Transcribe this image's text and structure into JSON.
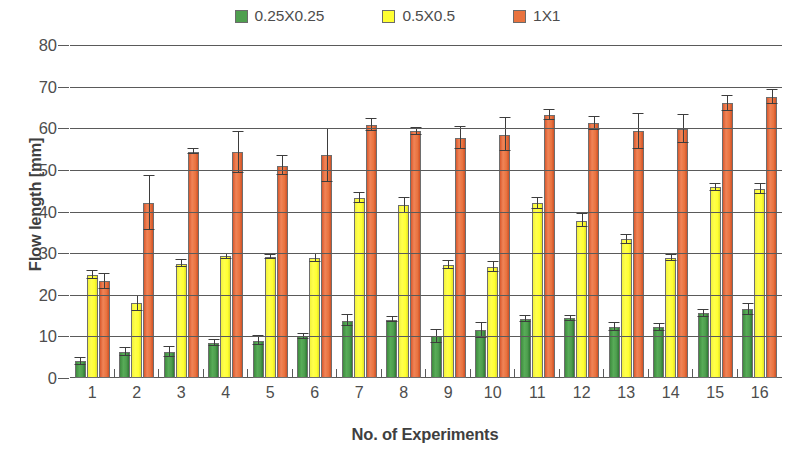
{
  "chart_data": {
    "type": "bar",
    "title": "",
    "xlabel": "No. of Experiments",
    "ylabel": "Flow length [mm]",
    "ylim": [
      0,
      80
    ],
    "ytick_labels": [
      "0",
      "10",
      "20",
      "30",
      "40",
      "50",
      "60",
      "70",
      "80"
    ],
    "ytick_values": [
      0,
      10,
      20,
      30,
      40,
      50,
      60,
      70,
      80
    ],
    "grid": true,
    "legend_position": "top-center",
    "categories": [
      "1",
      "2",
      "3",
      "4",
      "5",
      "6",
      "7",
      "8",
      "9",
      "10",
      "11",
      "12",
      "13",
      "14",
      "15",
      "16"
    ],
    "series": [
      {
        "name": "0.25X0.25",
        "color": "#4f9f4f",
        "values": [
          4.0,
          6.2,
          6.2,
          8.5,
          9.0,
          10.0,
          13.8,
          14.0,
          10.0,
          11.5,
          14.2,
          14.3,
          12.3,
          12.2,
          15.5,
          16.5
        ],
        "errors": [
          0.8,
          0.9,
          1.2,
          0.7,
          1.0,
          0.6,
          1.3,
          0.6,
          1.5,
          1.8,
          0.8,
          0.7,
          0.9,
          0.8,
          0.9,
          1.3
        ]
      },
      {
        "name": "0.5X0.5",
        "color": "#ffff33",
        "values": [
          24.8,
          18.0,
          27.5,
          29.2,
          29.0,
          28.8,
          43.2,
          41.5,
          27.2,
          26.6,
          42.0,
          37.8,
          33.3,
          28.8,
          45.8,
          45.5
        ],
        "errors": [
          1.0,
          1.8,
          0.8,
          0.7,
          0.5,
          1.0,
          1.2,
          1.8,
          1.0,
          1.2,
          1.3,
          1.5,
          1.0,
          0.7,
          0.9,
          1.2
        ]
      },
      {
        "name": "1X1",
        "color": "#e9733f",
        "values": [
          23.2,
          42.0,
          54.4,
          54.2,
          51.0,
          53.5,
          60.8,
          59.3,
          57.6,
          58.5,
          63.2,
          61.2,
          59.3,
          59.8,
          66.0,
          67.5
        ],
        "errors": [
          1.8,
          6.5,
          0.6,
          5.0,
          2.3,
          6.3,
          1.4,
          0.8,
          2.6,
          4.0,
          1.2,
          1.6,
          4.2,
          3.4,
          1.8,
          1.6
        ]
      }
    ]
  },
  "legend": {
    "items": [
      {
        "label": "0.25X0.25",
        "color": "#4f9f4f"
      },
      {
        "label": "0.5X0.5",
        "color": "#ffff33"
      },
      {
        "label": "1X1",
        "color": "#e9733f"
      }
    ]
  },
  "axes": {
    "y_title": "Flow length [mm]",
    "x_title": "No. of Experiments"
  }
}
